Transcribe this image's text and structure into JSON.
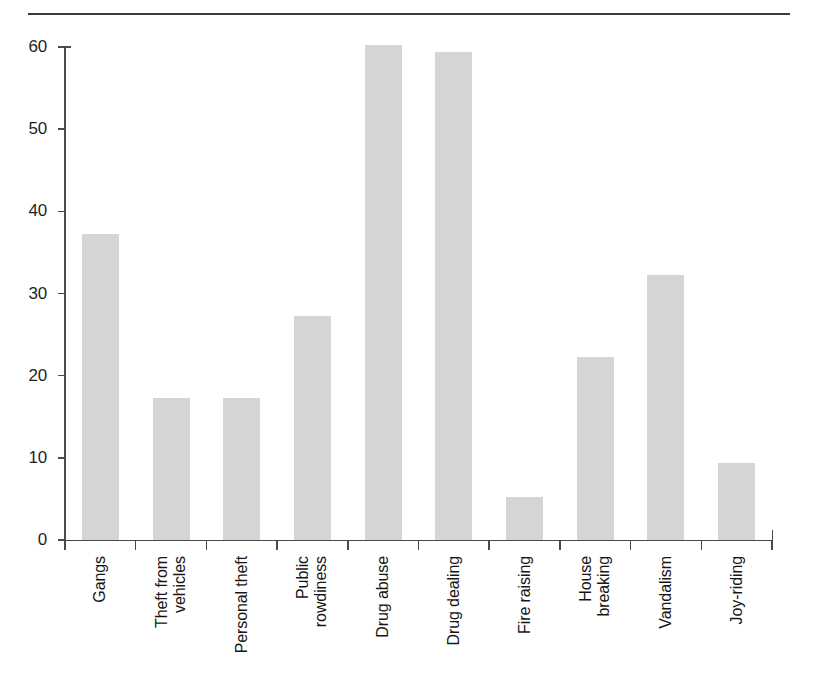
{
  "figure": {
    "top_rule": true,
    "background_color": "#ffffff",
    "bar_color": "#d5d5d5",
    "axis_color": "#4a4a4a"
  },
  "chart_data": {
    "type": "bar",
    "title": "",
    "subtitle": "",
    "xlabel": "",
    "ylabel": "",
    "ylim": [
      0,
      60
    ],
    "grid": false,
    "legend": null,
    "yticks": [
      0,
      10,
      20,
      30,
      40,
      50,
      60
    ],
    "ytick_labels": [
      "0",
      "10",
      "20",
      "30",
      "40",
      "50",
      "60"
    ],
    "categories": [
      "Gangs",
      "Theft from vehicles",
      "Personal theft",
      "Public rowdiness",
      "Drug abuse",
      "Drug dealing",
      "Fire raising",
      "House breaking",
      "Vandalism",
      "Joy-riding"
    ],
    "category_label_lines": [
      [
        "Gangs"
      ],
      [
        "Theft from",
        "vehicles"
      ],
      [
        "Personal theft"
      ],
      [
        "Public",
        "rowdiness"
      ],
      [
        "Drug abuse"
      ],
      [
        "Drug dealing"
      ],
      [
        "Fire raising"
      ],
      [
        "House",
        "breaking"
      ],
      [
        "Vandalism"
      ],
      [
        "Joy-riding"
      ]
    ],
    "values": [
      37.3,
      17.3,
      17.3,
      27.3,
      60.2,
      59.4,
      5.2,
      22.3,
      32.2,
      9.4
    ]
  }
}
